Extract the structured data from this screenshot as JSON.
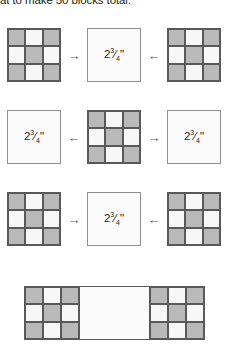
{
  "caption": {
    "text": "at to make 50 blocks total."
  },
  "colors": {
    "patch_gray": "#b9b9b9",
    "patch_white": "#f7f7f7",
    "outline": "#58595b",
    "text": "#231f20"
  },
  "measurement": {
    "whole": "2",
    "numerator": "3",
    "denominator": "4",
    "unit": "\"",
    "full": "2¾\""
  },
  "icons": {
    "arrow_right": "→",
    "arrow_left": "←"
  },
  "nine_patch": {
    "pattern": [
      "g",
      "w",
      "g",
      "w",
      "g",
      "w",
      "g",
      "w",
      "g"
    ]
  },
  "rows": [
    {
      "name": "row-1",
      "items": [
        {
          "kind": "nine-patch"
        },
        {
          "kind": "arrow",
          "direction": "right",
          "glyph": "→"
        },
        {
          "kind": "plain-square",
          "label": "2¾\""
        },
        {
          "kind": "arrow",
          "direction": "left",
          "glyph": "←"
        },
        {
          "kind": "nine-patch"
        }
      ]
    },
    {
      "name": "row-2",
      "items": [
        {
          "kind": "plain-square",
          "label": "2¾\""
        },
        {
          "kind": "arrow",
          "direction": "left",
          "glyph": "←"
        },
        {
          "kind": "nine-patch"
        },
        {
          "kind": "arrow",
          "direction": "right",
          "glyph": "→"
        },
        {
          "kind": "plain-square",
          "label": "2¾\""
        }
      ]
    },
    {
      "name": "row-3",
      "items": [
        {
          "kind": "nine-patch"
        },
        {
          "kind": "arrow",
          "direction": "right",
          "glyph": "→"
        },
        {
          "kind": "plain-square",
          "label": "2¾\""
        },
        {
          "kind": "arrow",
          "direction": "left",
          "glyph": "←"
        },
        {
          "kind": "nine-patch"
        }
      ]
    }
  ],
  "assembled_strip": {
    "name": "assembled-row",
    "segments": [
      "nine-patch",
      "plain-square",
      "nine-patch"
    ]
  }
}
